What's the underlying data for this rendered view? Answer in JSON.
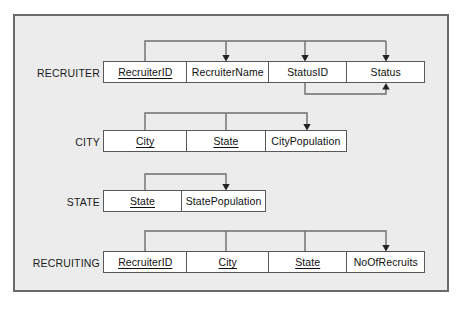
{
  "diagram": {
    "frame": {
      "border_color": "#6a6a6c",
      "background": "#ececed"
    },
    "relations": [
      {
        "name": "RECRUITER",
        "label": "RECRUITER",
        "attributes": [
          {
            "label": "RecruiterID",
            "key": true
          },
          {
            "label": "RecruiterName",
            "key": false
          },
          {
            "label": "StatusID",
            "key": false
          },
          {
            "label": "Status",
            "key": false
          }
        ]
      },
      {
        "name": "CITY",
        "label": "CITY",
        "attributes": [
          {
            "label": "City",
            "key": true
          },
          {
            "label": "State",
            "key": true
          },
          {
            "label": "CityPopulation",
            "key": false
          }
        ]
      },
      {
        "name": "STATE",
        "label": "STATE",
        "attributes": [
          {
            "label": "State",
            "key": true
          },
          {
            "label": "StatePopulation",
            "key": false
          }
        ]
      },
      {
        "name": "RECRUITING",
        "label": "RECRUITING",
        "attributes": [
          {
            "label": "RecruiterID",
            "key": true
          },
          {
            "label": "City",
            "key": true
          },
          {
            "label": "State",
            "key": true
          },
          {
            "label": "NoOfRecruits",
            "key": false
          }
        ]
      }
    ],
    "dependencies": [
      {
        "from": [
          "RECRUITER.RecruiterID"
        ],
        "to": [
          "RECRUITER.RecruiterName",
          "RECRUITER.StatusID",
          "RECRUITER.Status"
        ],
        "routing": "above"
      },
      {
        "from": [
          "RECRUITER.StatusID"
        ],
        "to": [
          "RECRUITER.Status"
        ],
        "routing": "below"
      },
      {
        "from": [
          "CITY.City",
          "CITY.State"
        ],
        "to": [
          "CITY.CityPopulation"
        ],
        "routing": "above"
      },
      {
        "from": [
          "STATE.State"
        ],
        "to": [
          "STATE.StatePopulation"
        ],
        "routing": "above"
      },
      {
        "from": [
          "RECRUITING.RecruiterID",
          "RECRUITING.City",
          "RECRUITING.State"
        ],
        "to": [
          "RECRUITING.NoOfRecruits"
        ],
        "routing": "above"
      }
    ],
    "colors": {
      "connector": "#6d6d70",
      "arrowhead": "#232326",
      "cell_border": "#58585a",
      "text": "#101010"
    }
  }
}
